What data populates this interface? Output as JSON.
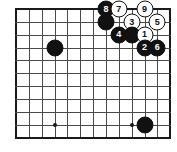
{
  "diagram": {
    "type": "go-board-diagram",
    "board": {
      "columns": 13,
      "rows": 11,
      "cell_size": 12.85,
      "origin_x": 16,
      "origin_y": 9,
      "line_color": "#4a4a4a",
      "edge_color": "#1a1a1a",
      "background_color": "#ffffff"
    },
    "star_points": [
      {
        "col": 3,
        "row": 9
      },
      {
        "col": 9,
        "row": 9
      }
    ],
    "stones": [
      {
        "col": 3,
        "row": 3,
        "color": "black",
        "label": ""
      },
      {
        "col": 10,
        "row": 9,
        "color": "black",
        "label": ""
      },
      {
        "col": 7,
        "row": 0,
        "color": "black",
        "label": "8"
      },
      {
        "col": 7,
        "row": 1,
        "color": "black",
        "label": ""
      },
      {
        "col": 8,
        "row": 0,
        "color": "white",
        "label": "7"
      },
      {
        "col": 10,
        "row": 0,
        "color": "white",
        "label": "9"
      },
      {
        "col": 9,
        "row": 1,
        "color": "white",
        "label": "3"
      },
      {
        "col": 11,
        "row": 1,
        "color": "white",
        "label": "5"
      },
      {
        "col": 8,
        "row": 2,
        "color": "black",
        "label": "4"
      },
      {
        "col": 9,
        "row": 2,
        "color": "black",
        "label": ""
      },
      {
        "col": 10,
        "row": 2,
        "color": "white",
        "label": "1"
      },
      {
        "col": 10,
        "row": 3,
        "color": "black",
        "label": "2"
      },
      {
        "col": 11,
        "row": 3,
        "color": "black",
        "label": "6"
      }
    ],
    "move_sequence": [
      "1",
      "2",
      "3",
      "4",
      "5",
      "6",
      "7",
      "8",
      "9"
    ]
  }
}
